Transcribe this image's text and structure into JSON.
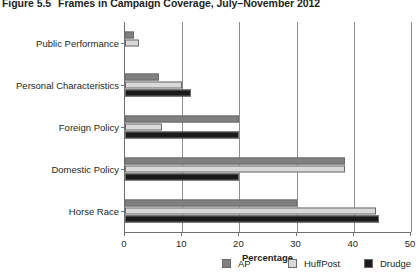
{
  "figure": {
    "label": "Figure 5.5",
    "title": "Frames in Campaign Coverage, July–November 2012"
  },
  "chart_data": {
    "type": "bar",
    "orientation": "horizontal",
    "title": "Frames in Campaign Coverage, July–November 2012",
    "xlabel": "Percentage",
    "ylabel": "",
    "xlim": [
      0,
      50
    ],
    "xticks": [
      0,
      10,
      20,
      30,
      40,
      50
    ],
    "xticklabels": [
      "0",
      "10",
      "20",
      "30",
      "40",
      "50"
    ],
    "grid": "vertical",
    "legend_position": "bottom",
    "categories": [
      "Public Performance",
      "Personal Characteristics",
      "Foreign Policy",
      "Domestic Policy",
      "Horse Race"
    ],
    "series": [
      {
        "name": "AP",
        "color": "#808080",
        "values": [
          1.5,
          6.0,
          20.0,
          38.5,
          30.0
        ]
      },
      {
        "name": "HuffPost",
        "color": "#d9d9d9",
        "values": [
          2.5,
          10.0,
          6.5,
          38.5,
          43.8
        ]
      },
      {
        "name": "Drudge",
        "color": "#1a1a1a",
        "values": [
          0.0,
          11.5,
          20.0,
          20.0,
          44.4
        ]
      }
    ]
  },
  "legend": {
    "items": [
      {
        "label": "AP",
        "color": "#808080"
      },
      {
        "label": "HuffPost",
        "color": "#d9d9d9"
      },
      {
        "label": "Drudge",
        "color": "#1a1a1a"
      }
    ]
  },
  "axis": {
    "x_title": "Percentage"
  }
}
